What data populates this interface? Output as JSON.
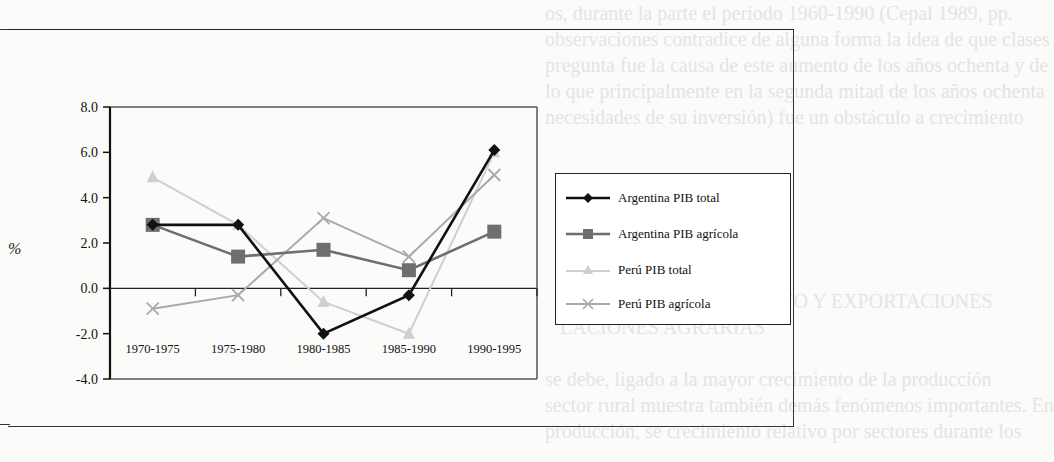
{
  "background_text": [
    "os, durante la parte el período 1960-1990 (Cepal 1989, pp.",
    "observaciones contradice de alguna forma la idea de que clases",
    "pregunta fue la causa de este aumento de los años ochenta y de",
    "lo que principalmente en la segunda mitad de los años ochenta",
    "necesidades de su inversión) fue un obstáculo a crecimiento",
    "CRECIMIENTO INTENSIVO Y EXPORTACIONES",
    "LACIONES AGRARIAS",
    "se debe, ligado a la mayor crecimiento de la producción",
    "sector rural muestra también demás fenómenos importantes. En",
    "producción, se crecimiento relativo por sectores durante los"
  ],
  "chart_data": {
    "type": "line",
    "title": "",
    "xlabel": "",
    "ylabel": "%",
    "categories": [
      "1970-1975",
      "1975-1980",
      "1980-1985",
      "1985-1990",
      "1990-1995"
    ],
    "ylim": [
      -4.0,
      8.0
    ],
    "yticks": [
      "8.0",
      "6.0",
      "4.0",
      "2.0",
      "0.0",
      "-2.0",
      "-4.0"
    ],
    "grid": false,
    "legend_position": "right",
    "series": [
      {
        "name": "Argentina PIB total",
        "values": [
          2.8,
          2.8,
          -2.0,
          -0.3,
          6.1
        ],
        "color": "#111111",
        "marker": "diamond"
      },
      {
        "name": "Argentina PIB agrícola",
        "values": [
          2.8,
          1.4,
          1.7,
          0.8,
          2.5
        ],
        "color": "#6e6e6e",
        "marker": "square"
      },
      {
        "name": "Perú PIB total",
        "values": [
          4.9,
          2.8,
          -0.6,
          -2.0,
          6.0
        ],
        "color": "#cfcfcf",
        "marker": "triangle"
      },
      {
        "name": "Perú PIB agrícola",
        "values": [
          -0.9,
          -0.3,
          3.1,
          1.4,
          5.0
        ],
        "color": "#a9a9a9",
        "marker": "x"
      }
    ]
  }
}
